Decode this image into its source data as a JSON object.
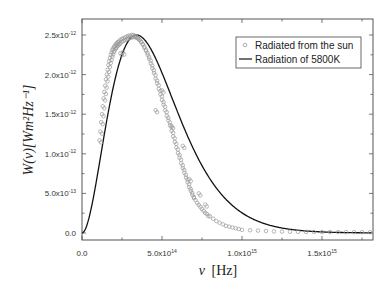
{
  "chart_data": {
    "type": "scatter",
    "title": "",
    "xlabel": "ν [Hz]",
    "ylabel": "W(ν)[Wm²Hz⁻¹]",
    "xlim": [
      0,
      1810000000000000.0
    ],
    "ylim": [
      -9e-14,
      2.7e-12
    ],
    "grid": false,
    "legend_position": "top-right",
    "x_ticks": [
      {
        "value": 0,
        "label": "0.0"
      },
      {
        "value": 500000000000000.0,
        "label": "5.0x10",
        "exp": "14"
      },
      {
        "value": 1000000000000000.0,
        "label": "1.0x10",
        "exp": "15"
      },
      {
        "value": 1500000000000000.0,
        "label": "1.5x10",
        "exp": "15"
      }
    ],
    "y_ticks": [
      {
        "value": 0,
        "label": "0.0"
      },
      {
        "value": 5e-13,
        "label": "5.0x10",
        "exp": "-13"
      },
      {
        "value": 1e-12,
        "label": "1.0x10",
        "exp": "-12"
      },
      {
        "value": 1.5e-12,
        "label": "1.5x10",
        "exp": "-12"
      },
      {
        "value": 2e-12,
        "label": "2.0x10",
        "exp": "-12"
      },
      {
        "value": 2.5e-12,
        "label": "2.5x10",
        "exp": "-12"
      }
    ],
    "series": [
      {
        "name": "Radiated from the sun",
        "style": "open-circle",
        "color": "#9a9a9a",
        "x": [
          110000000000000.0,
          115000000000000.0,
          120000000000000.0,
          125000000000000.0,
          130000000000000.0,
          135000000000000.0,
          140000000000000.0,
          145000000000000.0,
          150000000000000.0,
          155000000000000.0,
          160000000000000.0,
          165000000000000.0,
          170000000000000.0,
          175000000000000.0,
          180000000000000.0,
          185000000000000.0,
          190000000000000.0,
          195000000000000.0,
          200000000000000.0,
          205000000000000.0,
          210000000000000.0,
          215000000000000.0,
          220000000000000.0,
          225000000000000.0,
          230000000000000.0,
          240000000000000.0,
          250000000000000.0,
          260000000000000.0,
          270000000000000.0,
          280000000000000.0,
          290000000000000.0,
          300000000000000.0,
          310000000000000.0,
          320000000000000.0,
          330000000000000.0,
          340000000000000.0,
          350000000000000.0,
          360000000000000.0,
          370000000000000.0,
          380000000000000.0,
          390000000000000.0,
          400000000000000.0,
          410000000000000.0,
          420000000000000.0,
          430000000000000.0,
          440000000000000.0,
          450000000000000.0,
          460000000000000.0,
          470000000000000.0,
          480000000000000.0,
          490000000000000.0,
          500000000000000.0,
          510000000000000.0,
          520000000000000.0,
          530000000000000.0,
          540000000000000.0,
          550000000000000.0,
          560000000000000.0,
          570000000000000.0,
          580000000000000.0,
          590000000000000.0,
          600000000000000.0,
          610000000000000.0,
          620000000000000.0,
          630000000000000.0,
          640000000000000.0,
          650000000000000.0,
          660000000000000.0,
          670000000000000.0,
          680000000000000.0,
          690000000000000.0,
          700000000000000.0,
          720000000000000.0,
          740000000000000.0,
          760000000000000.0,
          780000000000000.0,
          800000000000000.0,
          820000000000000.0,
          840000000000000.0,
          860000000000000.0,
          880000000000000.0,
          900000000000000.0,
          920000000000000.0,
          940000000000000.0,
          960000000000000.0,
          980000000000000.0,
          1000000000000000.0,
          1050000000000000.0,
          1100000000000000.0,
          1150000000000000.0,
          1200000000000000.0,
          1250000000000000.0,
          1300000000000000.0,
          1350000000000000.0,
          1400000000000000.0,
          1450000000000000.0,
          1500000000000000.0,
          1550000000000000.0,
          1600000000000000.0,
          1650000000000000.0,
          1700000000000000.0,
          1750000000000000.0,
          1800000000000000.0,
          240000000000000.0,
          255000000000000.0,
          460000000000000.0,
          500000000000000.0,
          560000000000000.0,
          630000000000000.0,
          670000000000000.0,
          730000000000000.0,
          770000000000000.0
        ],
        "y": [
          1.17e-12,
          1.28e-12,
          1.4e-12,
          1.5e-12,
          1.6e-12,
          1.7e-12,
          1.78e-12,
          1.86e-12,
          1.94e-12,
          2e-12,
          2.06e-12,
          2.12e-12,
          2.17e-12,
          2.21e-12,
          2.25e-12,
          2.28e-12,
          2.31e-12,
          2.33e-12,
          2.35e-12,
          2.36e-12,
          2.38e-12,
          2.39e-12,
          2.4e-12,
          2.41e-12,
          2.42e-12,
          2.44e-12,
          2.45e-12,
          2.46e-12,
          2.47e-12,
          2.48e-12,
          2.49e-12,
          2.49e-12,
          2.5e-12,
          2.5e-12,
          2.49e-12,
          2.48e-12,
          2.46e-12,
          2.44e-12,
          2.41e-12,
          2.38e-12,
          2.34e-12,
          2.3e-12,
          2.25e-12,
          2.2e-12,
          2.14e-12,
          2.08e-12,
          2.02e-12,
          1.95e-12,
          1.89e-12,
          1.82e-12,
          1.75e-12,
          1.68e-12,
          1.62e-12,
          1.55e-12,
          1.48e-12,
          1.42e-12,
          1.36e-12,
          1.29e-12,
          1.22e-12,
          1.15e-12,
          1.08e-12,
          1.01e-12,
          9.5e-13,
          8.8e-13,
          8.2e-13,
          7.6e-13,
          7e-13,
          6.4e-13,
          5.8e-13,
          5.3e-13,
          4.8e-13,
          4.4e-13,
          3.8e-13,
          3.3e-13,
          2.8e-13,
          2.4e-13,
          2.1e-13,
          1.8e-13,
          1.5e-13,
          1.3e-13,
          1.1e-13,
          9e-14,
          8e-14,
          7e-14,
          6e-14,
          5e-14,
          4e-14,
          3.5e-14,
          3e-14,
          2.5e-14,
          2e-14,
          1.8e-14,
          1.6e-14,
          1.5e-14,
          1.4e-14,
          1.3e-14,
          1.2e-14,
          1.2e-14,
          1.1e-14,
          1.1e-14,
          1e-14,
          1e-14,
          1e-14,
          2.27e-12,
          2.28e-12,
          1.55e-12,
          1.8e-12,
          1.35e-12,
          1.1e-12,
          6.8e-13,
          5e-13,
          3.6e-13
        ]
      },
      {
        "name": "Radiation of 5800K",
        "style": "line",
        "color": "#111111",
        "x": [
          0,
          50000000000000.0,
          100000000000000.0,
          150000000000000.0,
          200000000000000.0,
          250000000000000.0,
          300000000000000.0,
          340000000000000.0,
          400000000000000.0,
          450000000000000.0,
          500000000000000.0,
          550000000000000.0,
          600000000000000.0,
          650000000000000.0,
          700000000000000.0,
          750000000000000.0,
          800000000000000.0,
          900000000000000.0,
          1000000000000000.0,
          1100000000000000.0,
          1200000000000000.0,
          1300000000000000.0,
          1400000000000000.0,
          1500000000000000.0,
          1600000000000000.0,
          1700000000000000.0,
          1810000000000000.0
        ],
        "y": [
          0,
          2.2e-13,
          7.5e-13,
          1.4e-12,
          1.95e-12,
          2.32e-12,
          2.48e-12,
          2.5e-12,
          2.4e-12,
          2.2e-12,
          1.94e-12,
          1.66e-12,
          1.38e-12,
          1.12e-12,
          8.9e-13,
          7e-13,
          5.4e-13,
          3.1e-13,
          1.7e-13,
          9e-14,
          5e-14,
          3e-14,
          1e-14,
          6e-15,
          3e-15,
          2e-15,
          1e-15
        ]
      }
    ]
  },
  "legend": {
    "items": [
      {
        "label": "Radiated from the sun",
        "marker": "open-circle"
      },
      {
        "label": "Radiation of 5800K",
        "marker": "line"
      }
    ]
  },
  "axes": {
    "xlabel_symbol": "ν",
    "xlabel_unit": "[Hz]",
    "ylabel": "W(ν)[Wm²Hz⁻¹]"
  }
}
